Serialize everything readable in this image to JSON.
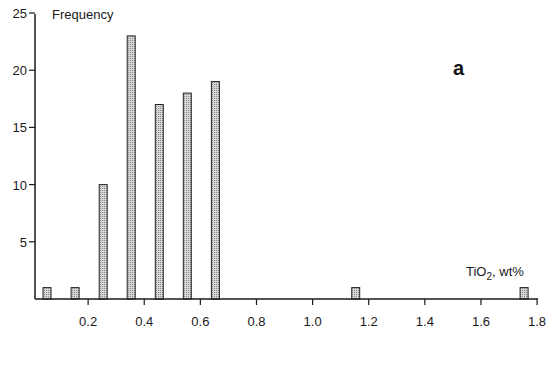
{
  "chart_data": {
    "type": "bar",
    "title": "",
    "panel_label": "a",
    "ylabel": "Frequency",
    "xlabel": "TiO2, wt%",
    "xlabel_parts": {
      "main": "TiO",
      "sub": "2",
      "rest": ", wt%"
    },
    "xlim": [
      0,
      1.8
    ],
    "ylim": [
      0,
      25
    ],
    "grid": false,
    "legend": null,
    "x_ticks": [
      0.2,
      0.4,
      0.6,
      0.8,
      1.0,
      1.2,
      1.4,
      1.6,
      1.8
    ],
    "x_tick_labels": [
      "0.2",
      "0.4",
      "0.6",
      "0.8",
      "1.0",
      "1.2",
      "1.4",
      "1.6",
      "1.8"
    ],
    "y_ticks": [
      5,
      10,
      15,
      20,
      25
    ],
    "y_tick_labels": [
      "5",
      "10",
      "15",
      "20",
      "25"
    ],
    "bin_width": 0.1,
    "categories": [
      "0.0-0.1",
      "0.1-0.2",
      "0.2-0.3",
      "0.3-0.4",
      "0.4-0.5",
      "0.5-0.6",
      "0.6-0.7",
      "1.1-1.2",
      "1.7-1.8"
    ],
    "bin_centers": [
      0.05,
      0.15,
      0.25,
      0.35,
      0.45,
      0.55,
      0.65,
      1.15,
      1.75
    ],
    "values": [
      1,
      1,
      10,
      23,
      17,
      18,
      19,
      1,
      1
    ],
    "bar_fill": "#c8c8c8",
    "bar_stroke": "#222222"
  }
}
